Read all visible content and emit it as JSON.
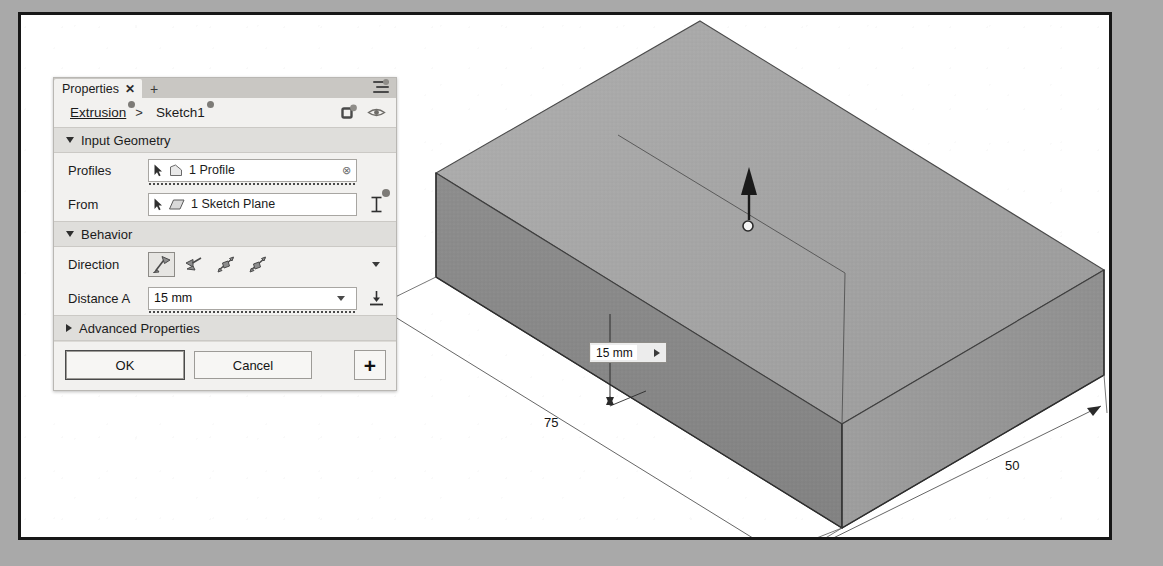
{
  "app": {
    "panel_title": "Properties",
    "tab_close_glyph": "✕",
    "tab_add_glyph": "+"
  },
  "breadcrumb": {
    "parent": "Extrusion",
    "separator": ">",
    "current": "Sketch1"
  },
  "sections": {
    "input_geometry": {
      "title": "Input Geometry",
      "expanded": true,
      "rows": [
        {
          "label": "Profiles",
          "value": "1 Profile",
          "clear_glyph": "⊗"
        },
        {
          "label": "From",
          "value": "1 Sketch Plane",
          "trail_icon": "extent-icon"
        }
      ]
    },
    "behavior": {
      "title": "Behavior",
      "expanded": true,
      "direction_label": "Direction",
      "direction_options": [
        "one-side",
        "flipped",
        "symmetric",
        "two-sided"
      ],
      "direction_selected": 0,
      "distance_label": "Distance A",
      "distance_value": "15 mm"
    },
    "advanced": {
      "title": "Advanced Properties",
      "expanded": false
    }
  },
  "footer": {
    "ok_label": "OK",
    "cancel_label": "Cancel",
    "add_glyph": "+"
  },
  "canvas": {
    "inline_editor_value": "15 mm",
    "dimensions": [
      {
        "name": "length",
        "text": "75"
      },
      {
        "name": "width",
        "text": "50"
      }
    ]
  },
  "colors": {
    "panel_bg": "#f2f1ef",
    "section_hdr": "#dfdedb",
    "tabstrip": "#c9c7c3",
    "model_top": "#a6a6a6",
    "model_top_light": "#b3b3b3",
    "model_front": "#8a8a8a",
    "model_side": "#9a9a9a",
    "outline": "#3a3a3a",
    "page_border": "#171717",
    "backdrop": "#a9a9a9"
  }
}
